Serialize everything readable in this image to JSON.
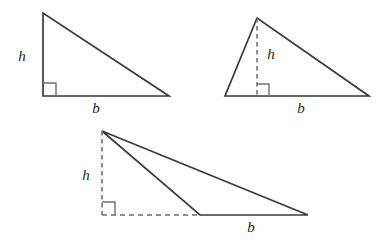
{
  "figure": {
    "background_color": "#ffffff",
    "stroke_color": "#3a3a3a",
    "dash_color": "#6b6b6b",
    "label_color": "#232323",
    "canvas": {
      "width": 389,
      "height": 248
    }
  },
  "triangles": [
    {
      "id": "right-triangle",
      "name": "Right triangle",
      "position": "top-left",
      "height_label": "h",
      "base_label": "b",
      "height_style": "solid-leg",
      "base_style": "solid",
      "has_right_angle_mark": true,
      "vertices": [
        {
          "name": "apex",
          "x": 43,
          "y": 13
        },
        {
          "name": "right-angle-corner",
          "x": 43,
          "y": 96
        },
        {
          "name": "base-right",
          "x": 169,
          "y": 96
        }
      ],
      "height_segment": {
        "x1": 43,
        "y1": 13,
        "x2": 43,
        "y2": 96
      },
      "base_segment": {
        "x1": 43,
        "y1": 96,
        "x2": 169,
        "y2": 96
      },
      "right_angle_mark": {
        "x": 43,
        "y": 96,
        "size": 13,
        "dir_x": 1,
        "dir_y": -1
      },
      "height_label_pos": {
        "x": 22,
        "y": 58
      },
      "base_label_pos": {
        "x": 96,
        "y": 110
      }
    },
    {
      "id": "acute-triangle",
      "name": "Acute triangle with interior height",
      "position": "top-right",
      "height_label": "h",
      "base_label": "b",
      "height_style": "dashed-interior",
      "base_style": "solid",
      "has_right_angle_mark": true,
      "vertices": [
        {
          "name": "apex",
          "x": 257,
          "y": 18
        },
        {
          "name": "base-left",
          "x": 225,
          "y": 96
        },
        {
          "name": "base-right",
          "x": 369,
          "y": 96
        }
      ],
      "height_segment": {
        "x1": 257,
        "y1": 18,
        "x2": 257,
        "y2": 96
      },
      "base_segment": {
        "x1": 225,
        "y1": 96,
        "x2": 369,
        "y2": 96
      },
      "right_angle_mark": {
        "x": 257,
        "y": 96,
        "size": 12,
        "dir_x": 1,
        "dir_y": -1
      },
      "height_label_pos": {
        "x": 271,
        "y": 56
      },
      "base_label_pos": {
        "x": 301,
        "y": 110
      }
    },
    {
      "id": "obtuse-triangle",
      "name": "Obtuse triangle with exterior height",
      "position": "bottom",
      "height_label": "h",
      "base_label": "b",
      "height_style": "dashed-exterior",
      "base_style": "solid-with-dashed-extension",
      "has_right_angle_mark": true,
      "vertices": [
        {
          "name": "apex",
          "x": 102,
          "y": 131
        },
        {
          "name": "obtuse-vertex",
          "x": 200,
          "y": 215
        },
        {
          "name": "base-right",
          "x": 308,
          "y": 215
        }
      ],
      "height_segment": {
        "x1": 102,
        "y1": 131,
        "x2": 102,
        "y2": 215
      },
      "base_extension_segment": {
        "x1": 102,
        "y1": 215,
        "x2": 200,
        "y2": 215
      },
      "base_segment": {
        "x1": 200,
        "y1": 215,
        "x2": 308,
        "y2": 215
      },
      "right_angle_mark": {
        "x": 102,
        "y": 215,
        "size": 13,
        "dir_x": 1,
        "dir_y": -1
      },
      "height_label_pos": {
        "x": 86,
        "y": 177
      },
      "base_label_pos": {
        "x": 251,
        "y": 229
      }
    }
  ]
}
